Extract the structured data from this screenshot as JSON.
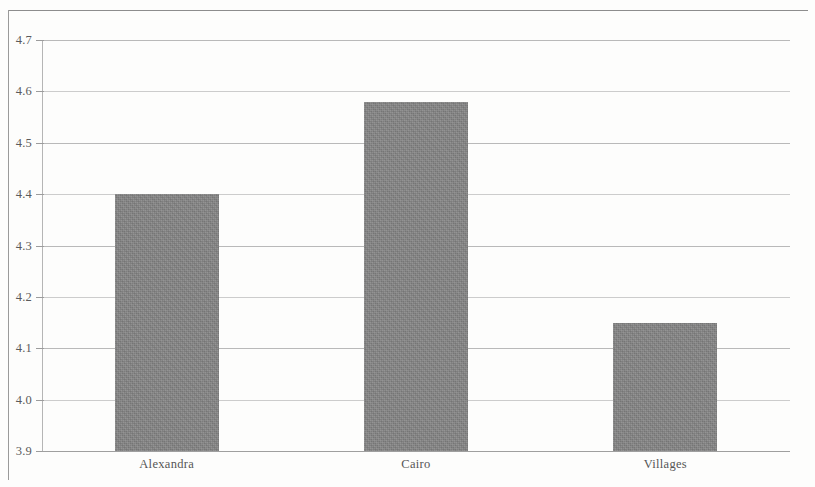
{
  "chart_data": {
    "type": "bar",
    "title": "",
    "subtitle": "",
    "xlabel": "",
    "ylabel": "",
    "categories": [
      "Alexandra",
      "Cairo",
      "Villages"
    ],
    "values": [
      4.4,
      4.58,
      4.15
    ],
    "series": [
      {
        "name": "",
        "values": [
          4.4,
          4.58,
          4.15
        ]
      }
    ],
    "ylim": [
      3.9,
      4.7
    ],
    "ytick_labels": [
      "4.7",
      "4.6",
      "4.5",
      "4.4",
      "4.3",
      "4.2",
      "4.1",
      "4.0",
      "3.9"
    ],
    "ytick_values": [
      4.7,
      4.6,
      4.5,
      4.4,
      4.3,
      4.2,
      4.1,
      4.0,
      3.9
    ],
    "grid": true,
    "grid_axis": "y",
    "legend": false,
    "legend_position": "none",
    "bar_color": "#848484",
    "gridline_color": "#b9b9b9",
    "axis_color": "#9f9f9f",
    "background_color": "#fdfdfc",
    "annotations": []
  },
  "figure": {
    "frame_border_color": "#8d8d8d"
  }
}
